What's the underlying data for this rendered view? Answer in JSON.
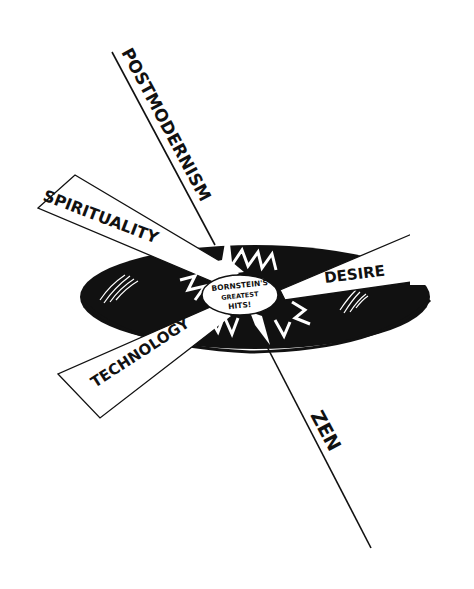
{
  "illustration": {
    "title": "Bornstein's Greatest Hits record with radiating concepts",
    "record_label": {
      "line1": "BORNSTEIN'S",
      "line2": "GREATEST",
      "line3": "HITS!"
    },
    "rays": [
      {
        "label": "POSTMODERNISM"
      },
      {
        "label": "SPIRITUALITY"
      },
      {
        "label": "DESIRE"
      },
      {
        "label": "TECHNOLOGY"
      },
      {
        "label": "ZEN"
      }
    ],
    "colors": {
      "ink": "#111111",
      "paper": "#ffffff"
    }
  }
}
